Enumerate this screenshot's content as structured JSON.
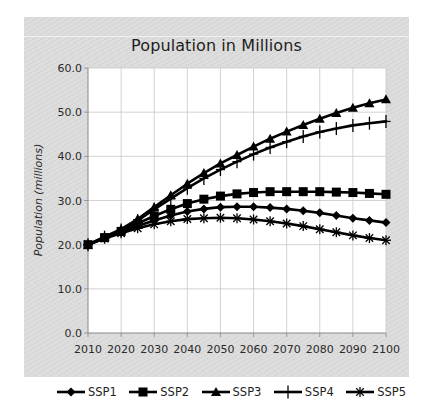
{
  "chart_data": {
    "type": "line",
    "title": "Population in Millions",
    "xlabel": "",
    "ylabel": "Population (millions)",
    "ylim": [
      0,
      60
    ],
    "xlim": [
      2010,
      2100
    ],
    "grid": true,
    "legend_position": "bottom",
    "y_ticks": [
      "0.0",
      "10.0",
      "20.0",
      "30.0",
      "40.0",
      "50.0",
      "60.0"
    ],
    "x_ticks": [
      "2010",
      "2020",
      "2030",
      "2040",
      "2050",
      "2060",
      "2070",
      "2080",
      "2090",
      "2100"
    ],
    "x": [
      2010,
      2015,
      2020,
      2025,
      2030,
      2035,
      2040,
      2045,
      2050,
      2055,
      2060,
      2065,
      2070,
      2075,
      2080,
      2085,
      2090,
      2095,
      2100
    ],
    "series": [
      {
        "name": "SSP1",
        "marker": "diamond",
        "values": [
          20.0,
          21.5,
          22.8,
          24.2,
          25.5,
          26.6,
          27.5,
          28.1,
          28.5,
          28.6,
          28.6,
          28.4,
          28.1,
          27.7,
          27.2,
          26.6,
          26.0,
          25.5,
          25.0
        ]
      },
      {
        "name": "SSP2",
        "marker": "square",
        "values": [
          20.0,
          21.6,
          23.0,
          24.8,
          26.5,
          28.0,
          29.3,
          30.3,
          31.0,
          31.5,
          31.8,
          32.0,
          32.0,
          32.0,
          32.0,
          31.9,
          31.8,
          31.6,
          31.4
        ]
      },
      {
        "name": "SSP3",
        "marker": "triangle",
        "values": [
          20.0,
          21.8,
          23.5,
          25.8,
          28.5,
          31.2,
          33.8,
          36.2,
          38.4,
          40.3,
          42.2,
          44.0,
          45.6,
          47.1,
          48.5,
          49.8,
          51.0,
          52.0,
          52.9
        ]
      },
      {
        "name": "SSP4",
        "marker": "plus",
        "values": [
          20.0,
          21.7,
          23.3,
          25.4,
          28.0,
          30.4,
          32.8,
          35.0,
          37.0,
          38.8,
          40.5,
          42.0,
          43.3,
          44.5,
          45.5,
          46.3,
          47.0,
          47.5,
          47.9
        ]
      },
      {
        "name": "SSP5",
        "marker": "asterisk",
        "values": [
          20.0,
          21.4,
          22.6,
          23.7,
          24.6,
          25.3,
          25.8,
          26.0,
          26.1,
          26.0,
          25.7,
          25.3,
          24.8,
          24.2,
          23.5,
          22.8,
          22.1,
          21.5,
          21.0
        ]
      }
    ]
  },
  "colors": {
    "panel_background": "#dcdcdc",
    "plot_background": "#ffffff",
    "gridline": "#c8c8c8",
    "series_line": "#000000",
    "text": "#1e1e1e"
  },
  "legend": [
    {
      "label": "SSP1",
      "marker": "diamond"
    },
    {
      "label": "SSP2",
      "marker": "square"
    },
    {
      "label": "SSP3",
      "marker": "triangle"
    },
    {
      "label": "SSP4",
      "marker": "plus"
    },
    {
      "label": "SSP5",
      "marker": "asterisk"
    }
  ]
}
